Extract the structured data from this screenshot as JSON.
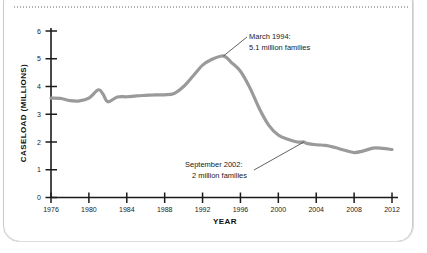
{
  "chart_data": {
    "type": "line",
    "title": "",
    "xlabel": "YEAR",
    "ylabel": "CASELOAD (MILLIONS)",
    "xlim": [
      1976,
      2012
    ],
    "ylim": [
      0,
      6
    ],
    "xticks": [
      1976,
      1980,
      1984,
      1988,
      1992,
      1996,
      2000,
      2004,
      2008,
      2012
    ],
    "xtick_labels": [
      "1976",
      "1980",
      "1984",
      "1988",
      "1992",
      "1996",
      "2000",
      "2004",
      "2008",
      "2012"
    ],
    "yticks": [
      0,
      1,
      2,
      3,
      4,
      5,
      6
    ],
    "ytick_labels": [
      "0",
      "1",
      "2",
      "3",
      "4",
      "5",
      "6"
    ],
    "grid": false,
    "legend": false,
    "line_color": "#9a9a9a",
    "line_width": 3.2,
    "series": [
      {
        "name": "AFDC/TANF caseload",
        "x": [
          1976,
          1977,
          1978,
          1979,
          1980,
          1981,
          1981.5,
          1982,
          1983,
          1984,
          1985,
          1986,
          1987,
          1988,
          1989,
          1990,
          1991,
          1992,
          1993,
          1994,
          1994.5,
          1995,
          1996,
          1997,
          1998,
          1999,
          2000,
          2001,
          2002,
          2002.7,
          2003,
          2004,
          2005,
          2006,
          2007,
          2008,
          2009,
          2010,
          2011,
          2012
        ],
        "values": [
          3.58,
          3.57,
          3.49,
          3.48,
          3.58,
          3.88,
          3.72,
          3.45,
          3.62,
          3.63,
          3.66,
          3.68,
          3.7,
          3.7,
          3.75,
          4.0,
          4.38,
          4.77,
          4.98,
          5.1,
          5.05,
          4.88,
          4.55,
          3.95,
          3.2,
          2.6,
          2.25,
          2.1,
          2.0,
          2.0,
          1.95,
          1.9,
          1.88,
          1.8,
          1.7,
          1.62,
          1.68,
          1.78,
          1.77,
          1.73
        ]
      }
    ],
    "annotations": [
      {
        "name": "peak-annotation",
        "line1": "March 1994:",
        "line2": "5.1 million families",
        "point_x": 1994.2,
        "point_y": 5.1
      },
      {
        "name": "trough-annotation",
        "line1": "September 2002:",
        "line2": "2 million families",
        "point_x": 2002.7,
        "point_y": 2.0
      }
    ]
  }
}
